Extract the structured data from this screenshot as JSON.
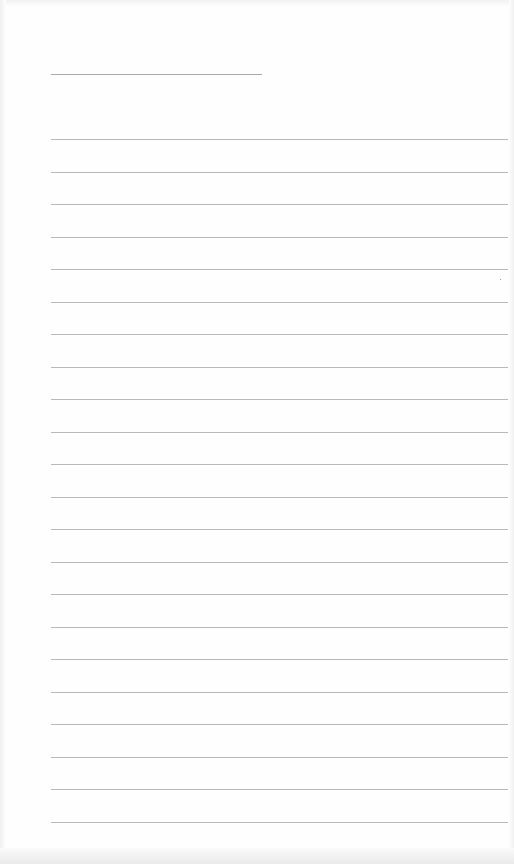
{
  "document": {
    "type": "lined-notebook-page",
    "header_line": {
      "x": 51,
      "y": 74,
      "width": 211
    },
    "ruled_lines": {
      "count": 22,
      "x": 51,
      "width": 457,
      "first_y": 139,
      "spacing": 32.5
    },
    "colors": {
      "paper": "#fefefe",
      "line": "#b9b9b9",
      "header_line": "#a9a9a9"
    },
    "text_content": ""
  }
}
